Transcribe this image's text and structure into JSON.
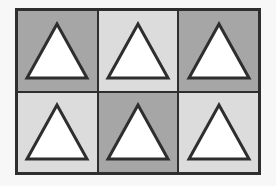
{
  "diagram": {
    "title": "",
    "rows": 2,
    "cols": 3,
    "colors": {
      "dark": "#a6a6a6",
      "light": "#dcdcdc",
      "triangle_fill": "#ffffff",
      "stroke": "#2e2e2e",
      "frame": "#2e2e2e"
    },
    "cells": [
      {
        "row": 0,
        "col": 0,
        "shade": "dark",
        "shape": "triangle"
      },
      {
        "row": 0,
        "col": 1,
        "shade": "light",
        "shape": "triangle"
      },
      {
        "row": 0,
        "col": 2,
        "shade": "dark",
        "shape": "triangle"
      },
      {
        "row": 1,
        "col": 0,
        "shade": "light",
        "shape": "triangle"
      },
      {
        "row": 1,
        "col": 1,
        "shade": "dark",
        "shape": "triangle"
      },
      {
        "row": 1,
        "col": 2,
        "shade": "light",
        "shape": "triangle"
      }
    ]
  }
}
